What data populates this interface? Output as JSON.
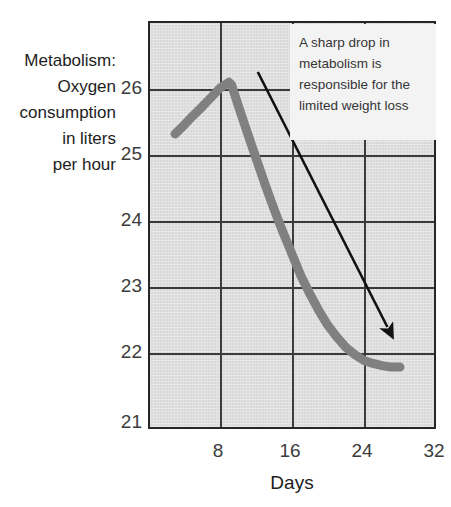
{
  "chart_data": {
    "type": "line",
    "title": "",
    "ylabel": "Metabolism:\nOxygen\nconsumption\nin liters\nper hour",
    "xlabel": "Days",
    "xlim": [
      0,
      32
    ],
    "ylim": [
      21,
      26.6
    ],
    "xticks": [
      8,
      16,
      24,
      32
    ],
    "xticklabels": [
      "8",
      "16",
      "24",
      "32"
    ],
    "yticks": [
      21,
      22,
      23,
      24,
      25,
      26
    ],
    "yticklabels": [
      "21",
      "22",
      "23",
      "24",
      "25",
      "26"
    ],
    "grid": true,
    "legend": false,
    "series": [
      {
        "name": "Oxygen consumption",
        "color": "#808080",
        "linewidth": 9,
        "x": [
          3,
          4,
          5,
          6,
          7,
          8,
          9,
          9.3,
          10,
          11,
          12,
          13,
          14,
          15,
          16,
          17,
          18,
          19,
          20,
          21,
          22,
          23,
          24,
          25,
          26,
          27,
          28
        ],
        "y": [
          25.05,
          25.17,
          25.3,
          25.42,
          25.55,
          25.68,
          25.76,
          25.72,
          25.45,
          25.08,
          24.72,
          24.36,
          24.02,
          23.7,
          23.4,
          23.1,
          22.85,
          22.62,
          22.42,
          22.26,
          22.12,
          22.02,
          21.94,
          21.9,
          21.87,
          21.85,
          21.85
        ]
      }
    ],
    "annotations": [
      {
        "name": "callout",
        "text": "A sharp drop in metabolism is responsible for the limited weight loss",
        "lines": [
          "A sharp drop in",
          "metabolism is",
          "responsible for the",
          "limited weight loss"
        ],
        "arrow": {
          "from_xy": [
            12.2,
            25.9
          ],
          "to_xy": [
            26.6,
            22.4
          ],
          "color": "#111111"
        }
      }
    ],
    "colors": {
      "plot_background": "#d9d9d9",
      "axis": "#262626",
      "gridline": "#3a3a3a",
      "series": "#808080",
      "annotation_background": "#f3f3f3",
      "annotation_text": "#353535",
      "tick_text": "#3c3c3c",
      "title_text": "#1d1d1d"
    }
  },
  "axes": {
    "y_title_text": "Metabolism:\nOxygen\nconsumption\nin liters\nper hour",
    "x_title_text": "Days",
    "y_tick_labels": [
      "26",
      "25",
      "24",
      "23",
      "22",
      "21"
    ],
    "x_tick_labels": [
      "8",
      "16",
      "24",
      "32"
    ]
  },
  "annotation": {
    "line1": "A sharp drop in",
    "line2": "metabolism is",
    "line3": "responsible for the",
    "line4": "limited weight loss"
  }
}
